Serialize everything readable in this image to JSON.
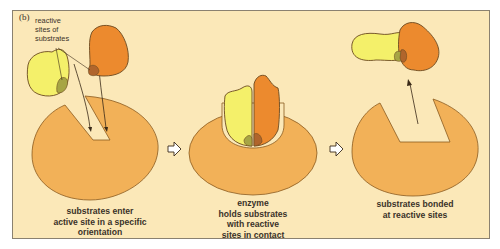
{
  "figure": {
    "panel_label": "(b)",
    "annotation": {
      "line1": "reactive",
      "line2": "sites of",
      "line3": "substrates"
    },
    "steps": [
      {
        "id": "step1",
        "caption": [
          "substrates enter",
          "active site in a specific",
          "orientation"
        ]
      },
      {
        "id": "step2",
        "caption": [
          "enzyme",
          "holds substrates",
          "with reactive",
          "sites in contact"
        ]
      },
      {
        "id": "step3",
        "caption": [
          "substrates bonded",
          "at reactive sites"
        ]
      }
    ],
    "arrows": [
      {
        "icon": "hollow-arrow-right-icon"
      },
      {
        "icon": "hollow-arrow-right-icon"
      }
    ],
    "colors": {
      "background": "#fbe8b8",
      "enzyme": "#f2b158",
      "substrate_yellow": "#f4f06a",
      "substrate_orange": "#ec8a2e",
      "reactive_site_green": "#a7a544",
      "reactive_site_brown": "#b0652c",
      "outline": "#6b4a20"
    }
  }
}
